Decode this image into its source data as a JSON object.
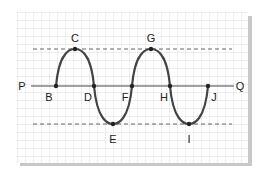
{
  "diagram": {
    "type": "transverse-wave",
    "line_labels": {
      "left": "P",
      "right": "Q"
    },
    "points": [
      {
        "label": "B",
        "role": "rest"
      },
      {
        "label": "C",
        "role": "crest"
      },
      {
        "label": "D",
        "role": "rest"
      },
      {
        "label": "E",
        "role": "trough"
      },
      {
        "label": "F",
        "role": "rest"
      },
      {
        "label": "G",
        "role": "crest"
      },
      {
        "label": "H",
        "role": "rest"
      },
      {
        "label": "I",
        "role": "trough"
      },
      {
        "label": "J",
        "role": "rest"
      }
    ],
    "colors": {
      "grid": "#d6d6d6",
      "wave": "#444444",
      "axis": "#444444",
      "dashed": "#555555",
      "shadow": "#c8c8c8"
    }
  }
}
